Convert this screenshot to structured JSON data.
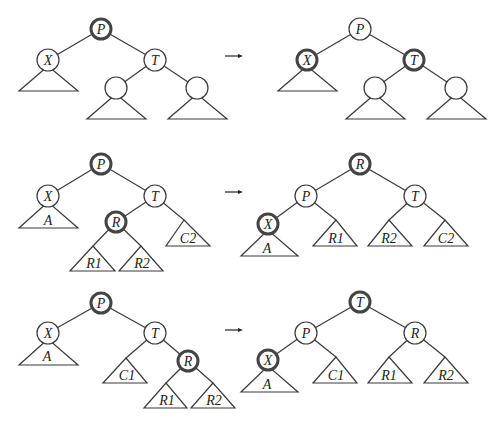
{
  "diagram": {
    "type": "binary-tree-rotation-cases",
    "colors": {
      "stroke": "#3a3a3a",
      "background": "#ffffff"
    },
    "rows": [
      {
        "before": {
          "nodes": [
            {
              "id": "P",
              "label": "P",
              "highlighted": true
            },
            {
              "id": "X",
              "label": "X",
              "highlighted": false
            },
            {
              "id": "T",
              "label": "T",
              "highlighted": false
            },
            {
              "id": "TL",
              "label": "",
              "highlighted": false
            },
            {
              "id": "TR",
              "label": "",
              "highlighted": false
            }
          ],
          "subtrees": [
            "",
            "",
            ""
          ]
        },
        "arrow": "→",
        "after": {
          "nodes": [
            {
              "id": "P",
              "label": "P",
              "highlighted": false
            },
            {
              "id": "X",
              "label": "X",
              "highlighted": true
            },
            {
              "id": "T",
              "label": "T",
              "highlighted": true
            },
            {
              "id": "TL",
              "label": "",
              "highlighted": false
            },
            {
              "id": "TR",
              "label": "",
              "highlighted": false
            }
          ],
          "subtrees": [
            "",
            "",
            ""
          ]
        }
      },
      {
        "before": {
          "nodes": [
            {
              "id": "P",
              "label": "P",
              "highlighted": true
            },
            {
              "id": "X",
              "label": "X",
              "highlighted": false
            },
            {
              "id": "T",
              "label": "T",
              "highlighted": false
            },
            {
              "id": "R",
              "label": "R",
              "highlighted": true
            }
          ],
          "subtrees": [
            "A",
            "R1",
            "R2",
            "C2"
          ]
        },
        "arrow": "→",
        "after": {
          "nodes": [
            {
              "id": "R",
              "label": "R",
              "highlighted": true
            },
            {
              "id": "P",
              "label": "P",
              "highlighted": false
            },
            {
              "id": "T",
              "label": "T",
              "highlighted": false
            },
            {
              "id": "X",
              "label": "X",
              "highlighted": true
            }
          ],
          "subtrees": [
            "A",
            "R1",
            "R2",
            "C2"
          ]
        }
      },
      {
        "before": {
          "nodes": [
            {
              "id": "P",
              "label": "P",
              "highlighted": true
            },
            {
              "id": "X",
              "label": "X",
              "highlighted": false
            },
            {
              "id": "T",
              "label": "T",
              "highlighted": false
            },
            {
              "id": "R",
              "label": "R",
              "highlighted": true
            }
          ],
          "subtrees": [
            "A",
            "C1",
            "R1",
            "R2"
          ]
        },
        "arrow": "→",
        "after": {
          "nodes": [
            {
              "id": "T",
              "label": "T",
              "highlighted": true
            },
            {
              "id": "P",
              "label": "P",
              "highlighted": false
            },
            {
              "id": "R",
              "label": "R",
              "highlighted": false
            },
            {
              "id": "X",
              "label": "X",
              "highlighted": true
            }
          ],
          "subtrees": [
            "A",
            "C1",
            "R1",
            "R2"
          ]
        }
      }
    ]
  }
}
